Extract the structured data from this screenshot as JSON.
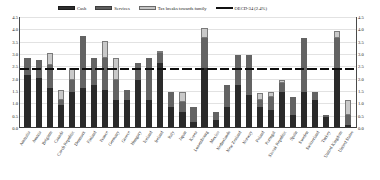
{
  "chart_data": {
    "type": "bar",
    "stacked": true,
    "title": "",
    "subtitle": "",
    "xlabel": "",
    "ylabel": "",
    "ylim": [
      0.0,
      4.5
    ],
    "yticks": [
      "0.0",
      "0.5",
      "1.0",
      "1.5",
      "2.0",
      "2.5",
      "3.0",
      "3.5",
      "4.0",
      "4.5"
    ],
    "grid": true,
    "dual_axis": true,
    "legend_position": "top",
    "legend": [
      {
        "label": "Cash",
        "color": "#2a2a2a",
        "key": "cash"
      },
      {
        "label": "Services",
        "color": "#636363",
        "key": "services"
      },
      {
        "label": "Tax breaks towards family",
        "color": "#c9c9c9",
        "key": "tax"
      },
      {
        "label": "OECD-34 (2.4%)",
        "color": "#0d0d0d",
        "key": "oecd_average"
      }
    ],
    "reference_line": {
      "label": "OECD-34 (2.4%)",
      "value": 2.4,
      "style": "dashed",
      "color": "#0d0d0d"
    },
    "categories": [
      "Australia",
      "Austria",
      "Belgium",
      "Canada",
      "Czech Republic",
      "Denmark",
      "Finland",
      "France",
      "Germany",
      "Greece",
      "Hungary",
      "Iceland",
      "Ireland",
      "Italy",
      "Japan",
      "Korea",
      "Luxembourg",
      "Mexico",
      "Netherlands",
      "New Zealand",
      "Norway",
      "Poland",
      "Portugal",
      "Slovak Republic",
      "Spain",
      "Sweden",
      "Switzerland",
      "Turkey",
      "United Kingdom",
      "United States"
    ],
    "series": [
      {
        "name": "Cash",
        "key": "cash",
        "color": "#2a2a2a",
        "values": [
          2.1,
          2.0,
          1.6,
          0.9,
          1.4,
          1.6,
          1.7,
          1.5,
          1.1,
          1.1,
          1.9,
          1.1,
          2.6,
          0.8,
          0.6,
          0.2,
          2.4,
          0.3,
          0.8,
          1.7,
          1.3,
          0.8,
          0.7,
          1.4,
          0.5,
          1.4,
          1.1,
          0.4,
          2.3,
          0.1
        ]
      },
      {
        "name": "Services",
        "key": "services",
        "color": "#636363",
        "values": [
          0.7,
          0.7,
          0.9,
          0.2,
          0.5,
          2.1,
          1.1,
          1.3,
          0.8,
          0.4,
          0.7,
          1.7,
          0.4,
          0.6,
          0.4,
          0.6,
          1.2,
          0.3,
          0.9,
          1.2,
          1.6,
          0.3,
          0.5,
          0.4,
          0.7,
          2.2,
          0.3,
          0.1,
          1.3,
          0.4
        ]
      },
      {
        "name": "Tax breaks towards family",
        "key": "tax",
        "color": "#c9c9c9",
        "values": [
          0.0,
          0.0,
          0.5,
          0.4,
          0.5,
          0.0,
          0.0,
          0.7,
          0.9,
          0.0,
          0.0,
          0.0,
          0.1,
          0.0,
          0.4,
          0.0,
          0.4,
          0.0,
          0.0,
          0.0,
          0.0,
          0.3,
          0.2,
          0.1,
          0.0,
          0.0,
          0.0,
          0.0,
          0.3,
          0.6
        ]
      }
    ],
    "totals": [
      2.8,
      2.7,
      3.0,
      1.5,
      2.4,
      3.7,
      2.8,
      3.5,
      2.8,
      1.5,
      2.6,
      2.8,
      3.1,
      1.4,
      1.4,
      0.8,
      4.0,
      0.6,
      1.7,
      2.9,
      2.9,
      1.4,
      1.4,
      1.9,
      1.2,
      3.6,
      1.4,
      0.5,
      3.9,
      1.1
    ]
  }
}
